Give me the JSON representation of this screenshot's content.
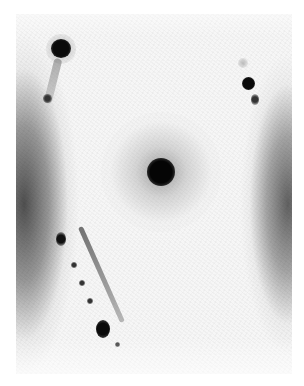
{
  "image": {
    "description": "Grayscale photographic plate with a central dark compact source surrounded by a diffuse halo, dark vertical bands along the left and right edges, two bright spots near the top corners with faint trailing features, and a diagonal chain of dark knots in the lower left.",
    "colors": {
      "background": "#ffffff",
      "plate": "#f6f6f6",
      "dark": "#111111",
      "band": "#6e6e6e"
    },
    "features": [
      {
        "name": "central-source",
        "x": 161,
        "y": 172,
        "r": 13
      },
      {
        "name": "top-left-spot",
        "x": 60,
        "y": 48,
        "r": 9
      },
      {
        "name": "top-left-tail-spot",
        "x": 47,
        "y": 99,
        "r": 4
      },
      {
        "name": "top-right-spot",
        "x": 248,
        "y": 84,
        "r": 6
      },
      {
        "name": "top-right-tail-spot",
        "x": 255,
        "y": 100,
        "r": 3
      },
      {
        "name": "chain-head",
        "x": 61,
        "y": 237,
        "r": 5
      },
      {
        "name": "chain-end",
        "x": 103,
        "y": 330,
        "r": 6
      },
      {
        "name": "chain-tail-dot",
        "x": 117,
        "y": 344,
        "r": 2
      }
    ]
  }
}
